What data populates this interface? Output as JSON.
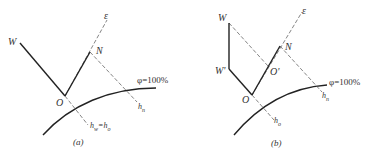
{
  "figure": {
    "panel_a": {
      "caption": "(a)",
      "labels": {
        "W": "W",
        "O": "O",
        "N": "N",
        "epsilon": "ε",
        "phi": "φ=100%",
        "hn": "h",
        "hn_sub": "n",
        "hw": "h",
        "hw_sub": "w",
        "eq": "=h",
        "ho_sub": "o"
      }
    },
    "panel_b": {
      "caption": "(b)",
      "labels": {
        "W": "W",
        "W_prime": "W'",
        "O": "O",
        "O_prime": "O'",
        "N": "N",
        "epsilon": "ε",
        "phi": "φ=100%",
        "hn": "h",
        "hn_sub": "n",
        "ho": "h",
        "ho_sub": "o"
      }
    },
    "colors": {
      "line": "#222222",
      "dashed": "#555555",
      "text": "#333333"
    }
  }
}
